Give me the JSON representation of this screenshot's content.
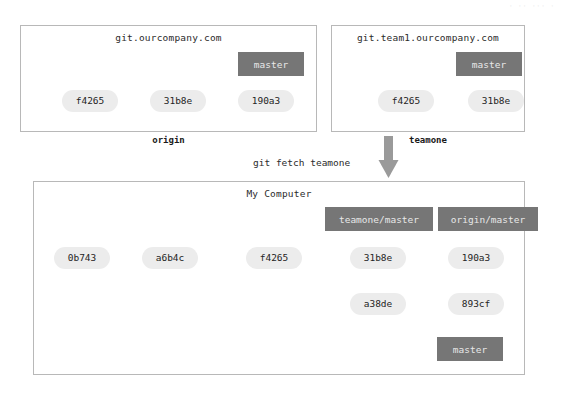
{
  "page": {
    "background": "#ffffff",
    "node_color": "#ececec",
    "branch_color": "#767676",
    "branch_text_color": "#e8e8e8",
    "border_color": "#b8b8b8",
    "arrow_color": "#8c8c8c",
    "big_arrow_color": "#9a9a9a",
    "artifact_text": "· ·· ··· ·"
  },
  "remotes": [
    {
      "id": "origin",
      "title": "git.ourcompany.com",
      "caption": "origin",
      "commits": [
        {
          "id": "origin-f4265",
          "label": "f4265"
        },
        {
          "id": "origin-31b8e",
          "label": "31b8e"
        },
        {
          "id": "origin-190a3",
          "label": "190a3"
        }
      ],
      "branch": {
        "id": "origin-master",
        "label": "master",
        "points_to": "origin-190a3"
      }
    },
    {
      "id": "teamone",
      "title": "git.team1.ourcompany.com",
      "caption": "teamone",
      "commits": [
        {
          "id": "teamone-f4265",
          "label": "f4265"
        },
        {
          "id": "teamone-31b8e",
          "label": "31b8e"
        }
      ],
      "branch": {
        "id": "teamone-master",
        "label": "master",
        "points_to": "teamone-31b8e"
      }
    }
  ],
  "operation": {
    "command": "git fetch teamone",
    "direction": "down"
  },
  "local": {
    "title": "My Computer",
    "caption": "",
    "commits_main": [
      {
        "id": "local-0b743",
        "label": "0b743"
      },
      {
        "id": "local-a6b4c",
        "label": "a6b4c"
      },
      {
        "id": "local-f4265",
        "label": "f4265"
      },
      {
        "id": "local-31b8e",
        "label": "31b8e"
      },
      {
        "id": "local-190a3",
        "label": "190a3"
      }
    ],
    "commits_branch": [
      {
        "id": "local-a38de",
        "label": "a38de"
      },
      {
        "id": "local-893cf",
        "label": "893cf"
      }
    ],
    "branches": [
      {
        "id": "local-teamone-master",
        "label": "teamone/master",
        "points_to": "local-31b8e"
      },
      {
        "id": "local-origin-master",
        "label": "origin/master",
        "points_to": "local-190a3"
      },
      {
        "id": "local-master",
        "label": "master",
        "points_to": "local-893cf"
      }
    ]
  }
}
